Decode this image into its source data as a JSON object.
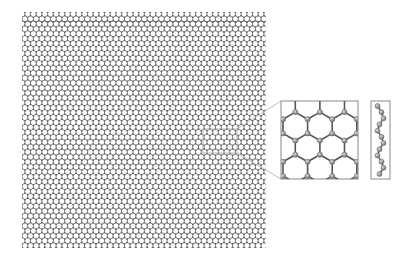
{
  "figure": {
    "colors": {
      "background": "#ffffff",
      "bond": "#555555",
      "atom_small": "#6a6a6a",
      "atom_inset": "#9a9a9a",
      "atom_inset_stroke": "#6e6e6e",
      "frame": "#8a8a8a",
      "connector": "#b0b0b0",
      "selection": "#a8a8a8"
    },
    "main_lattice": {
      "x": 22,
      "y": 12,
      "width": 244,
      "height": 236,
      "bond_length": 5.3
    },
    "selection_box": {
      "x": 203,
      "y": 129,
      "width": 34,
      "height": 24
    },
    "inset_top_view": {
      "x": 281,
      "y": 101,
      "width": 77,
      "height": 78,
      "hex_columns": 3,
      "hex_rows": 3
    },
    "inset_side_view": {
      "x": 371,
      "y": 101,
      "width": 19,
      "height": 78,
      "atoms": 12
    }
  }
}
